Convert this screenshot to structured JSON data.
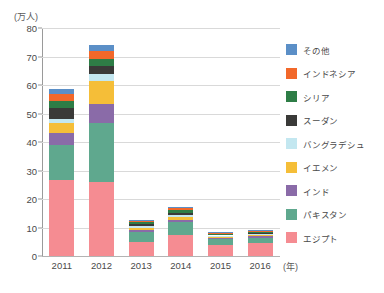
{
  "chart_data": {
    "type": "bar",
    "stacked": true,
    "title": "",
    "subtitle": "",
    "xlabel": "(年)",
    "ylabel": "(万人)",
    "ylim": [
      0,
      80
    ],
    "ytick_step": 10,
    "yticks": [
      "80",
      "70",
      "60",
      "50",
      "40",
      "30",
      "20",
      "10",
      "0"
    ],
    "grid": true,
    "legend_position": "right",
    "categories": [
      "2011",
      "2012",
      "2013",
      "2014",
      "2015",
      "2016"
    ],
    "series": [
      {
        "name": "エジプト",
        "color": "#F58C92",
        "values": [
          26.5,
          26.0,
          4.8,
          7.2,
          3.7,
          4.4
        ]
      },
      {
        "name": "パキスタン",
        "color": "#5FA88E",
        "values": [
          12.5,
          20.5,
          3.7,
          4.8,
          2.3,
          2.0
        ]
      },
      {
        "name": "インド",
        "color": "#8A6BA8",
        "values": [
          4.0,
          7.0,
          0.6,
          0.7,
          0.4,
          0.5
        ]
      },
      {
        "name": "イエメン",
        "color": "#F5BE38",
        "values": [
          3.5,
          8.0,
          0.9,
          1.0,
          0.5,
          0.6
        ]
      },
      {
        "name": "バングラデシュ",
        "color": "#C3E7F0",
        "values": [
          1.5,
          2.5,
          0.5,
          0.6,
          0.3,
          0.3
        ]
      },
      {
        "name": "スーダン",
        "color": "#3A3A38",
        "values": [
          4.0,
          2.5,
          0.7,
          0.8,
          0.4,
          0.4
        ]
      },
      {
        "name": "シリア",
        "color": "#2E7D46",
        "values": [
          2.5,
          2.5,
          0.6,
          0.9,
          0.3,
          0.3
        ]
      },
      {
        "name": "インドネシア",
        "color": "#F2682A",
        "values": [
          2.5,
          3.0,
          0.5,
          0.7,
          0.2,
          0.3
        ]
      },
      {
        "name": "その他",
        "color": "#5B8FC7",
        "values": [
          1.5,
          2.0,
          0.5,
          0.6,
          0.2,
          0.2
        ]
      }
    ],
    "totals": [
      61.5,
      77.5,
      12.8,
      16.8,
      8.3,
      9.0
    ]
  },
  "legend": {
    "items": [
      {
        "label": "その他",
        "color": "#5B8FC7"
      },
      {
        "label": "インドネシア",
        "color": "#F2682A"
      },
      {
        "label": "シリア",
        "color": "#2E7D46"
      },
      {
        "label": "スーダン",
        "color": "#3A3A38"
      },
      {
        "label": "バングラデシュ",
        "color": "#C3E7F0"
      },
      {
        "label": "イエメン",
        "color": "#F5BE38"
      },
      {
        "label": "インド",
        "color": "#8A6BA8"
      },
      {
        "label": "パキスタン",
        "color": "#5FA88E"
      },
      {
        "label": "エジプト",
        "color": "#F58C92"
      }
    ]
  }
}
